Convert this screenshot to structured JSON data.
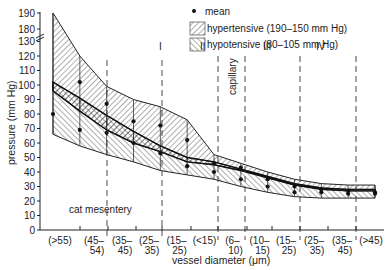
{
  "chart_data": {
    "type": "area",
    "title": "",
    "xlabel": "vessel diameter (μm)",
    "ylabel": "pressure (mm Hg)",
    "ylim": [
      0,
      190
    ],
    "y_axis_break": {
      "from": 130,
      "to": 180
    },
    "yticks": [
      0,
      10,
      20,
      30,
      40,
      50,
      60,
      70,
      80,
      90,
      100,
      110,
      120,
      130,
      180,
      190
    ],
    "categories": [
      {
        "top": "(>55)",
        "bottom": ""
      },
      {
        "top": "(45–",
        "bottom": "54)"
      },
      {
        "top": "(35–",
        "bottom": "45)"
      },
      {
        "top": "(25–",
        "bottom": "35)"
      },
      {
        "top": "(15–",
        "bottom": "25)"
      },
      {
        "top": "(<15)",
        "bottom": ""
      },
      {
        "top": "(6–",
        "bottom": "10)"
      },
      {
        "top": "(10–",
        "bottom": "15)"
      },
      {
        "top": "(15–",
        "bottom": "25)"
      },
      {
        "top": "(25–",
        "bottom": "35)"
      },
      {
        "top": "(35–",
        "bottom": "45)"
      },
      {
        "top": "(>45)",
        "bottom": ""
      }
    ],
    "legend": [
      {
        "symbol": "dot",
        "label": "mean"
      },
      {
        "symbol": "hatch-right",
        "label": "hypertensive (190–150 mm Hg)"
      },
      {
        "symbol": "hatch-left",
        "label": "hypotensive  (80–105 mm Hg)"
      }
    ],
    "legend_position": "top-right",
    "grid": false,
    "annotations": [
      {
        "text": "cat mesentery",
        "x": 4,
        "y": 12
      },
      {
        "text": "I",
        "region": "arterioles 35–25 μm"
      },
      {
        "text": "II",
        "region": "arterioles 15–<15 μm"
      },
      {
        "text": "capillary",
        "region": "6–10 μm",
        "rotated": true
      },
      {
        "text": "III",
        "region": "venules 10–25 μm"
      },
      {
        "text": "IV",
        "region": "venules 25–45 μm"
      }
    ],
    "series": [
      {
        "name": "hypertensive",
        "x": [
          0,
          1,
          2,
          3,
          4,
          5,
          6,
          7,
          8,
          9,
          10,
          11,
          12
        ],
        "upper": [
          190,
          120,
          99,
          90,
          85,
          76,
          52,
          46,
          40,
          35,
          32,
          31,
          31
        ],
        "lower": [
          96,
          82,
          69,
          60,
          54,
          47,
          45,
          41,
          36,
          31,
          28,
          27,
          27
        ],
        "mean": [
          null,
          102,
          87,
          75,
          72,
          62,
          46,
          43,
          35,
          30,
          28,
          27,
          26
        ]
      },
      {
        "name": "hypotensive",
        "x": [
          0,
          1,
          2,
          3,
          4,
          5,
          6,
          7,
          8,
          9,
          10,
          11,
          12
        ],
        "upper": [
          102,
          91,
          79,
          68,
          58,
          50,
          47,
          42,
          37,
          32,
          29,
          28,
          28
        ],
        "lower": [
          66,
          58,
          52,
          47,
          41,
          38,
          35,
          30,
          26,
          23,
          22,
          22,
          22
        ],
        "mean": [
          80,
          69,
          67,
          60,
          53,
          44,
          40,
          35,
          30,
          26,
          26,
          25,
          25
        ]
      }
    ],
    "region_labels": {
      "I": "I",
      "II": "II",
      "capillary": "capillary",
      "III": "III",
      "IV": "IV",
      "mesentery": "cat mesentery"
    }
  }
}
